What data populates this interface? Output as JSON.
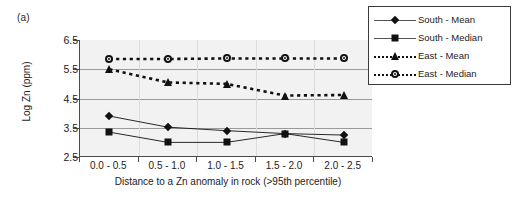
{
  "panel": {
    "letter": "(a)"
  },
  "chart_data": {
    "type": "line",
    "title": "",
    "subtitle": "",
    "xlabel": "Distance to a Zn anomaly in rock (>95th percentile)",
    "ylabel": "Log Zn (ppm)",
    "categories": [
      "0.0 - 0.5",
      "0.5 - 1.0",
      "1.0 - 1.5",
      "1.5 - 2.0",
      "2.0 - 2.5"
    ],
    "ylim": [
      2.5,
      6.5
    ],
    "yticks": [
      6.5,
      5.5,
      4.5,
      3.5,
      2.5
    ],
    "ytick_labels": [
      "6.5",
      "5.5",
      "4.5",
      "3.5",
      "2.5"
    ],
    "grid": "horizontal",
    "legend_position": "top-right",
    "series": [
      {
        "name": "South - Mean",
        "marker": "diamond",
        "linestyle": "solid",
        "color": "#111111",
        "values": [
          3.9,
          3.52,
          3.4,
          3.3,
          3.25
        ]
      },
      {
        "name": "South - Median",
        "marker": "square",
        "linestyle": "solid",
        "color": "#111111",
        "values": [
          3.35,
          3.0,
          3.0,
          3.3,
          3.0
        ]
      },
      {
        "name": "East - Mean",
        "marker": "triangle",
        "linestyle": "dotted",
        "color": "#111111",
        "values": [
          5.5,
          5.05,
          5.0,
          4.6,
          4.62
        ]
      },
      {
        "name": "East - Median",
        "marker": "circle",
        "linestyle": "dotted",
        "color": "#111111",
        "values": [
          5.85,
          5.85,
          5.87,
          5.87,
          5.87
        ]
      }
    ]
  }
}
